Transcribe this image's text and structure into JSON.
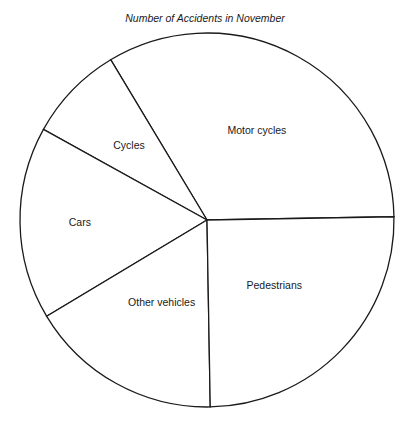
{
  "chart_data": {
    "type": "pie",
    "title": "Number of Accidents in November",
    "start_angle_deg": 1,
    "direction": "counterclockwise",
    "slices": [
      {
        "label": "Motor cycles",
        "share_percent": 33.3,
        "angle_deg": 120
      },
      {
        "label": "Cycles",
        "share_percent": 8.3,
        "angle_deg": 30
      },
      {
        "label": "Cars",
        "share_percent": 16.7,
        "angle_deg": 60
      },
      {
        "label": "Other vehicles",
        "share_percent": 16.7,
        "angle_deg": 60
      },
      {
        "label": "Pedestrians",
        "share_percent": 25.0,
        "angle_deg": 90
      }
    ],
    "legend": "none",
    "labels_inside": true
  }
}
